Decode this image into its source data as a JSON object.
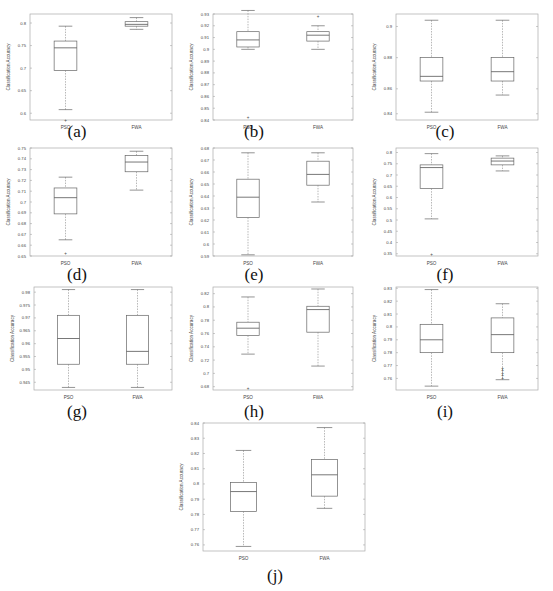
{
  "figure": {
    "ylabel": "Classification Accuracy",
    "categories": [
      "PSO",
      "FWA"
    ]
  },
  "chart_data": [
    {
      "id": "a",
      "type": "box",
      "caption": "(a)",
      "ylabel": "Classification Accuracy",
      "categories": [
        "PSO",
        "FWA"
      ],
      "ylim": [
        0.585,
        0.82
      ],
      "yticks": [
        0.6,
        0.65,
        0.7,
        0.75,
        0.8
      ],
      "ytick_labels": [
        "0.6",
        "0.65",
        "0.7",
        "0.75",
        "0.8"
      ],
      "series": [
        {
          "name": "PSO",
          "whisker_low": 0.608,
          "q1": 0.695,
          "median": 0.745,
          "q3": 0.76,
          "whisker_high": 0.793,
          "outliers": [
            0.585
          ]
        },
        {
          "name": "FWA",
          "whisker_low": 0.786,
          "q1": 0.793,
          "median": 0.797,
          "q3": 0.803,
          "whisker_high": 0.812,
          "outliers": []
        }
      ]
    },
    {
      "id": "b",
      "type": "box",
      "caption": "(b)",
      "ylabel": "Classification Accuracy",
      "categories": [
        "PSO",
        "FWA"
      ],
      "ylim": [
        0.938,
        0.935
      ],
      "yticks": [
        0.94,
        0.95,
        0.96,
        0.97,
        0.98,
        0.99,
        0.9,
        0.91,
        0.92,
        0.93
      ],
      "ytick_labels": [
        "0.84",
        "0.85",
        "0.86",
        "0.87",
        "0.88",
        "0.89",
        "0.9",
        "0.91",
        "0.92",
        "0.93"
      ],
      "axis": {
        "min": 0.84,
        "max": 0.93
      },
      "series": [
        {
          "name": "PSO",
          "whisker_low": 0.9,
          "q1": 0.902,
          "median": 0.908,
          "q3": 0.915,
          "whisker_high": 0.933,
          "outliers": [
            0.842
          ]
        },
        {
          "name": "FWA",
          "whisker_low": 0.9,
          "q1": 0.907,
          "median": 0.912,
          "q3": 0.915,
          "whisker_high": 0.92,
          "outliers": [
            0.928
          ]
        }
      ]
    },
    {
      "id": "c",
      "type": "box",
      "caption": "(c)",
      "ylabel": "Classification Accuracy",
      "categories": [
        "PSO",
        "FWA"
      ],
      "axis": {
        "min": 0.84,
        "max": 0.908
      },
      "yticks": [
        0.844,
        0.86,
        0.88,
        0.9
      ],
      "ytick_labels": [
        "0.84",
        "0.86",
        "0.88",
        "0.9"
      ],
      "ytick_values": [
        0.844,
        0.86,
        0.88,
        0.9
      ],
      "series": [
        {
          "name": "PSO",
          "whisker_low": 0.845,
          "q1": 0.865,
          "median": 0.868,
          "q3": 0.88,
          "whisker_high": 0.904,
          "outliers": []
        },
        {
          "name": "FWA",
          "whisker_low": 0.856,
          "q1": 0.865,
          "median": 0.871,
          "q3": 0.88,
          "whisker_high": 0.904,
          "outliers": []
        }
      ]
    },
    {
      "id": "d",
      "type": "box",
      "caption": "(d)",
      "ylabel": "Classification Accuracy",
      "categories": [
        "PSO",
        "FWA"
      ],
      "axis": {
        "min": 0.65,
        "max": 0.75
      },
      "yticks": [
        0.65,
        0.66,
        0.67,
        0.68,
        0.69,
        0.7,
        0.71,
        0.72,
        0.73,
        0.74,
        0.75
      ],
      "ytick_labels": [
        "0.65",
        "0.66",
        "0.67",
        "0.68",
        "0.69",
        "0.7",
        "0.71",
        "0.72",
        "0.73",
        "0.74",
        "0.75"
      ],
      "series": [
        {
          "name": "PSO",
          "whisker_low": 0.665,
          "q1": 0.689,
          "median": 0.704,
          "q3": 0.713,
          "whisker_high": 0.723,
          "outliers": [
            0.652
          ]
        },
        {
          "name": "FWA",
          "whisker_low": 0.711,
          "q1": 0.728,
          "median": 0.737,
          "q3": 0.743,
          "whisker_high": 0.747,
          "outliers": []
        }
      ]
    },
    {
      "id": "e",
      "type": "box",
      "caption": "(e)",
      "ylabel": "Classification Accuracy",
      "categories": [
        "PSO",
        "FWA"
      ],
      "axis": {
        "min": 0.59,
        "max": 0.68
      },
      "yticks": [
        0.59,
        0.6,
        0.61,
        0.62,
        0.63,
        0.64,
        0.65,
        0.66,
        0.67,
        0.68
      ],
      "ytick_labels": [
        "0.59",
        "0.6",
        "0.61",
        "0.62",
        "0.63",
        "0.64",
        "0.65",
        "0.66",
        "0.67",
        "0.68"
      ],
      "series": [
        {
          "name": "PSO",
          "whisker_low": 0.591,
          "q1": 0.622,
          "median": 0.639,
          "q3": 0.654,
          "whisker_high": 0.676,
          "outliers": []
        },
        {
          "name": "FWA",
          "whisker_low": 0.635,
          "q1": 0.649,
          "median": 0.658,
          "q3": 0.669,
          "whisker_high": 0.676,
          "outliers": []
        }
      ]
    },
    {
      "id": "f",
      "type": "box",
      "caption": "(f)",
      "ylabel": "Classification Accuracy",
      "categories": [
        "PSO",
        "FWA"
      ],
      "axis": {
        "min": 0.34,
        "max": 0.82
      },
      "yticks": [
        0.35,
        0.4,
        0.45,
        0.5,
        0.55,
        0.6,
        0.65,
        0.7,
        0.75,
        0.8
      ],
      "ytick_labels": [
        "0.35",
        "0.4",
        "0.45",
        "0.5",
        "0.55",
        "0.6",
        "0.65",
        "0.7",
        "0.75",
        "0.8"
      ],
      "series": [
        {
          "name": "PSO",
          "whisker_low": 0.505,
          "q1": 0.64,
          "median": 0.733,
          "q3": 0.745,
          "whisker_high": 0.795,
          "outliers": [
            0.348
          ]
        },
        {
          "name": "FWA",
          "whisker_low": 0.718,
          "q1": 0.745,
          "median": 0.762,
          "q3": 0.775,
          "whisker_high": 0.785,
          "outliers": []
        }
      ]
    },
    {
      "id": "g",
      "type": "box",
      "caption": "(g)",
      "ylabel": "Classification Accuracy",
      "categories": [
        "PSO",
        "FWA"
      ],
      "axis": {
        "min": 0.942,
        "max": 0.982
      },
      "yticks": [
        0.945,
        0.95,
        0.955,
        0.96,
        0.965,
        0.97,
        0.975,
        0.98
      ],
      "ytick_labels": [
        "0.945",
        "0.95",
        "0.955",
        "0.96",
        "0.965",
        "0.97",
        "0.975",
        "0.98"
      ],
      "series": [
        {
          "name": "PSO",
          "whisker_low": 0.943,
          "q1": 0.952,
          "median": 0.962,
          "q3": 0.971,
          "whisker_high": 0.981,
          "outliers": []
        },
        {
          "name": "FWA",
          "whisker_low": 0.943,
          "q1": 0.952,
          "median": 0.957,
          "q3": 0.971,
          "whisker_high": 0.981,
          "outliers": []
        }
      ]
    },
    {
      "id": "h",
      "type": "box",
      "caption": "(h)",
      "ylabel": "Classification Accuracy",
      "categories": [
        "PSO",
        "FWA"
      ],
      "axis": {
        "min": 0.675,
        "max": 0.83
      },
      "yticks": [
        0.68,
        0.7,
        0.72,
        0.74,
        0.76,
        0.78,
        0.8,
        0.82
      ],
      "ytick_labels": [
        "0.68",
        "0.7",
        "0.72",
        "0.74",
        "0.76",
        "0.78",
        "0.8",
        "0.82"
      ],
      "series": [
        {
          "name": "PSO",
          "whisker_low": 0.729,
          "q1": 0.757,
          "median": 0.768,
          "q3": 0.777,
          "whisker_high": 0.815,
          "outliers": [
            0.678
          ]
        },
        {
          "name": "FWA",
          "whisker_low": 0.711,
          "q1": 0.762,
          "median": 0.796,
          "q3": 0.801,
          "whisker_high": 0.827,
          "outliers": []
        }
      ]
    },
    {
      "id": "i",
      "type": "box",
      "caption": "(i)",
      "ylabel": "Classification Accuracy",
      "categories": [
        "PSO",
        "FWA"
      ],
      "axis": {
        "min": 0.751,
        "max": 0.831
      },
      "yticks": [
        0.76,
        0.77,
        0.78,
        0.79,
        0.8,
        0.81,
        0.82,
        0.83
      ],
      "ytick_labels": [
        "0.76",
        "0.77",
        "0.78",
        "0.79",
        "0.8",
        "0.81",
        "0.82",
        "0.83"
      ],
      "series": [
        {
          "name": "PSO",
          "whisker_low": 0.754,
          "q1": 0.78,
          "median": 0.79,
          "q3": 0.802,
          "whisker_high": 0.829,
          "outliers": []
        },
        {
          "name": "FWA",
          "whisker_low": 0.759,
          "q1": 0.78,
          "median": 0.794,
          "q3": 0.807,
          "whisker_high": 0.818,
          "outliers": [
            0.76,
            0.762,
            0.764,
            0.766,
            0.768
          ]
        }
      ]
    },
    {
      "id": "j",
      "type": "box",
      "caption": "(j)",
      "ylabel": "Classification Accuracy",
      "categories": [
        "PSO",
        "FWA"
      ],
      "axis": {
        "min": 0.756,
        "max": 0.84
      },
      "yticks": [
        0.76,
        0.77,
        0.78,
        0.79,
        0.8,
        0.81,
        0.82,
        0.83,
        0.84
      ],
      "ytick_labels": [
        "0.76",
        "0.77",
        "0.78",
        "0.79",
        "0.8",
        "0.81",
        "0.82",
        "0.83",
        "0.84"
      ],
      "series": [
        {
          "name": "PSO",
          "whisker_low": 0.759,
          "q1": 0.782,
          "median": 0.795,
          "q3": 0.801,
          "whisker_high": 0.822,
          "outliers": []
        },
        {
          "name": "FWA",
          "whisker_low": 0.784,
          "q1": 0.792,
          "median": 0.806,
          "q3": 0.816,
          "whisker_high": 0.837,
          "outliers": []
        }
      ]
    }
  ]
}
